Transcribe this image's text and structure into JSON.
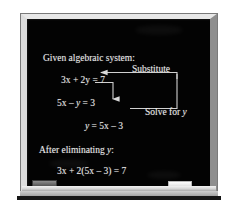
{
  "figure": {
    "name": "blackboard-algebra-substitution",
    "board_color": "#030303",
    "frame_color": "#d8d8d8",
    "chalk_color": "#e9e9e9"
  },
  "board": {
    "lines": {
      "given_heading": "Given algebraic system:",
      "equation_1": "3x + 2y = 7",
      "equation_2": "5x – y = 3",
      "equation_3": "y = 5x – 3",
      "after_heading": "After eliminating y:",
      "result_equation": "3x + 2(5x – 3) = 7"
    },
    "annotations": {
      "substitute_label": "Substitute",
      "solve_label": "Solve for y"
    }
  },
  "tray": {
    "eraser_label": "eraser",
    "chalk_label": "chalk"
  }
}
